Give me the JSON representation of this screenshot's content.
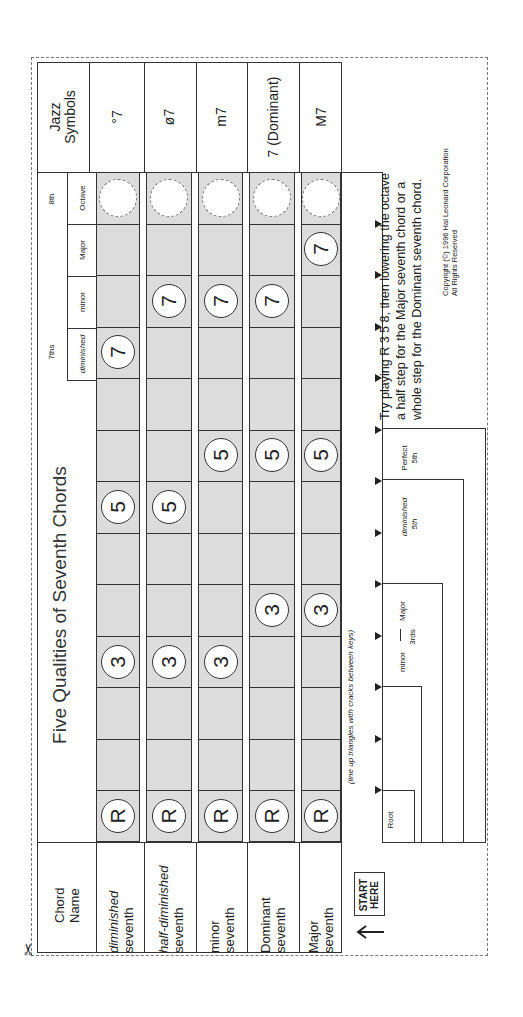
{
  "title": "Five Qualities of Seventh Chords",
  "header": {
    "chord_name_label": "Chord Name",
    "jazz_symbols_label": "Jazz Symbols",
    "sevenths_group_label": "7ths",
    "eighth_group_label": "8th",
    "interval_headers": [
      "diminished",
      "minor",
      "Major",
      "Octave"
    ]
  },
  "chords": [
    {
      "name_line1": "diminished",
      "name_line2": "seventh",
      "italic": true,
      "symbol": "°7",
      "notes": {
        "R": 0,
        "3": 3,
        "5": 6,
        "7": 9
      }
    },
    {
      "name_line1": "half-diminished",
      "name_line2": "seventh",
      "italic": true,
      "symbol": "ø7",
      "notes": {
        "R": 0,
        "3": 3,
        "5": 6,
        "7": 10
      }
    },
    {
      "name_line1": "minor",
      "name_line2": "seventh",
      "italic": false,
      "symbol": "m7",
      "notes": {
        "R": 0,
        "3": 3,
        "5": 7,
        "7": 10
      }
    },
    {
      "name_line1": "Dominant",
      "name_line2": "seventh",
      "italic": false,
      "symbol": "7 (Dominant)",
      "notes": {
        "R": 0,
        "3": 4,
        "5": 7,
        "7": 10
      }
    },
    {
      "name_line1": "Major",
      "name_line2": "seventh",
      "italic": false,
      "symbol": "M7",
      "notes": {
        "R": 0,
        "3": 4,
        "5": 7,
        "7": 11
      }
    }
  ],
  "note_labels": {
    "root": "R",
    "third": "3",
    "fifth": "5",
    "seventh": "7"
  },
  "bottom_labels": {
    "line_up_hint": "(line up triangles with cracks between keys)",
    "root": "Root",
    "minor": "minor",
    "major": "Major",
    "thirds": "3rds",
    "diminished_fifth": "diminished",
    "perfect_fifth": "Perfect",
    "fifth": "5th"
  },
  "start_here": {
    "line1": "START",
    "line2": "HERE"
  },
  "instructions": {
    "line1": "Try playing R 3 5 8, then lowering the octave",
    "line2": "a half step for the Major seventh chord or a",
    "line3": "whole step for the Dominant seventh chord."
  },
  "copyright": {
    "line1": "Copyright (©) 1996 Hal Leonard Corporation",
    "line2": "All Rights Reserved"
  },
  "colors": {
    "shade": "#dcdcdc",
    "line": "#333333",
    "dash": "#777777"
  }
}
